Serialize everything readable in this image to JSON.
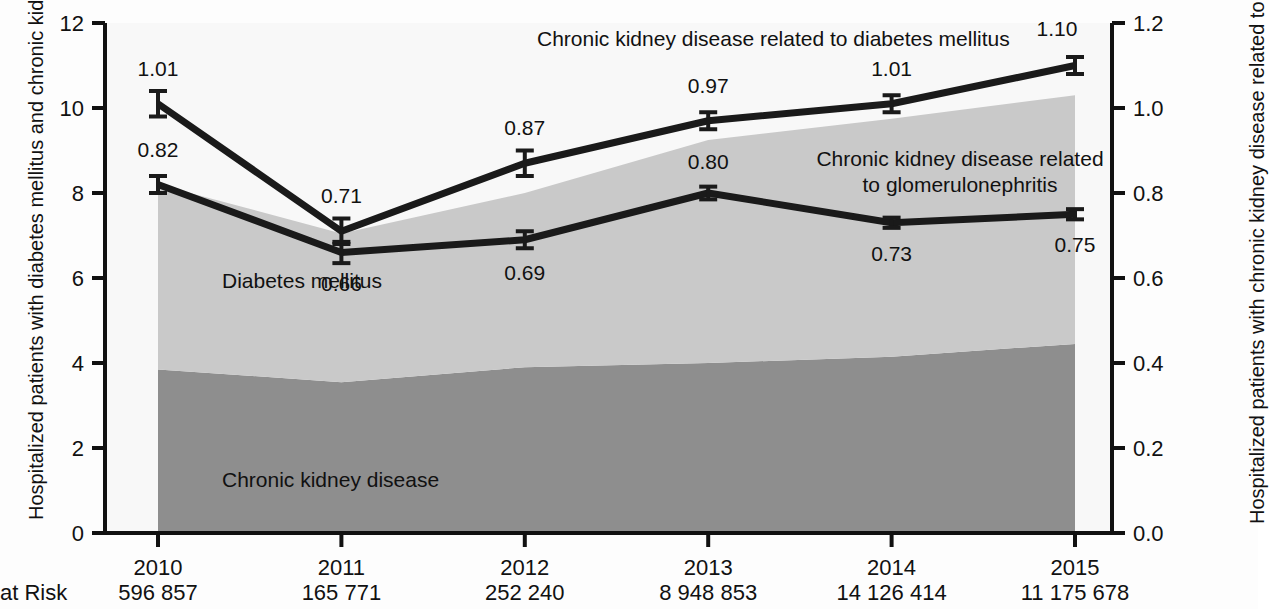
{
  "axes": {
    "left_label": "Hospitalized patients with diabetes mellitus and chronic kidney disease (%)",
    "right_label": "Hospitalized patients with chronic kidney disease related to diabetes mellitus and to glomerulonephritis (%)",
    "left_ticks": [
      "12",
      "10",
      "8",
      "6",
      "4",
      "2",
      "0"
    ],
    "right_ticks": [
      "1.2",
      "1.0",
      "0.8",
      "0.6",
      "0.4",
      "0.2",
      "0.0"
    ],
    "x_ticks": [
      "2010",
      "2011",
      "2012",
      "2013",
      "2014",
      "2015"
    ]
  },
  "annotations": {
    "area_upper": "Diabetes mellitus",
    "area_lower": "Chronic kidney disease",
    "line_dm": "Chronic kidney disease related to diabetes mellitus",
    "line_gn_1": "Chronic kidney disease related",
    "line_gn_2": "to glomerulonephritis"
  },
  "at_risk": {
    "label": "at Risk",
    "values": [
      "596 857",
      "165 771",
      "252 240",
      "8 948 853",
      "14 126 414",
      "11 175 678"
    ]
  },
  "colors": {
    "area_upper": "#c9c9c9",
    "area_lower": "#8e8e8e",
    "line": "#1a1a1a",
    "axis": "#111111",
    "background": "#fdfdfd"
  },
  "chart_data": {
    "type": "area",
    "title": "",
    "xlabel": "",
    "ylabel": "Hospitalized patients with diabetes mellitus and chronic kidney disease (%)",
    "y2label": "Hospitalized patients with chronic kidney disease related to diabetes mellitus and to glomerulonephritis (%)",
    "categories": [
      "2010",
      "2011",
      "2012",
      "2013",
      "2014",
      "2015"
    ],
    "ylim": [
      0,
      12
    ],
    "y2lim": [
      0,
      1.2
    ],
    "grid": false,
    "legend_position": "inline-annotations",
    "series": [
      {
        "name": "Chronic kidney disease",
        "kind": "area-stacked",
        "axis": "left",
        "values": [
          3.85,
          3.55,
          3.9,
          4.0,
          4.15,
          4.45
        ]
      },
      {
        "name": "Diabetes mellitus",
        "kind": "area-stacked",
        "axis": "left",
        "values": [
          4.35,
          3.5,
          4.1,
          5.25,
          5.6,
          5.85
        ]
      },
      {
        "name": "Diabetes mellitus (cumulative top)",
        "kind": "area-top",
        "axis": "left",
        "values": [
          8.2,
          7.05,
          8.0,
          9.25,
          9.75,
          10.3
        ]
      },
      {
        "name": "Chronic kidney disease related to diabetes mellitus",
        "kind": "line",
        "axis": "right",
        "values": [
          1.01,
          0.71,
          0.87,
          0.97,
          1.01,
          1.1
        ],
        "labels": [
          "1.01",
          "0.71",
          "0.87",
          "0.97",
          "1.01",
          "1.10"
        ],
        "errors": [
          0.03,
          0.03,
          0.03,
          0.02,
          0.02,
          0.02
        ]
      },
      {
        "name": "Chronic kidney disease related to glomerulonephritis",
        "kind": "line",
        "axis": "right",
        "values": [
          0.82,
          0.66,
          0.69,
          0.8,
          0.73,
          0.75
        ],
        "labels": [
          "0.82",
          "0.66",
          "0.69",
          "0.80",
          "0.73",
          "0.75"
        ],
        "errors": [
          0.02,
          0.025,
          0.02,
          0.015,
          0.012,
          0.012
        ]
      }
    ]
  }
}
